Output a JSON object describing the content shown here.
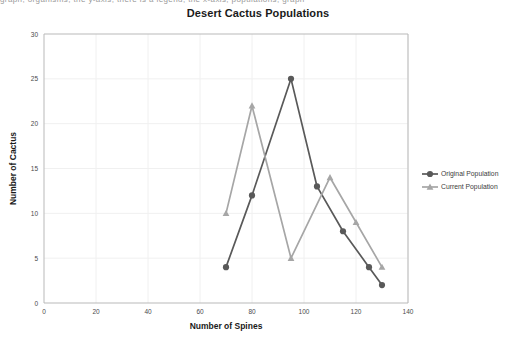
{
  "top_cut_text": "graph, organisms, the y-axis, there is a legend, the x-axis, populations, graph",
  "chart_data": {
    "type": "line",
    "title": "Desert Cactus Populations",
    "xlabel": "Number of Spines",
    "ylabel": "Number of Cactus",
    "xlim": [
      0,
      140
    ],
    "ylim": [
      0,
      30
    ],
    "xticks": [
      "0",
      "20",
      "40",
      "60",
      "80",
      "100",
      "120",
      "140"
    ],
    "yticks": [
      "0",
      "5",
      "10",
      "15",
      "20",
      "25",
      "30"
    ],
    "grid": true,
    "legend_position": "right",
    "series": [
      {
        "name": "Original Population",
        "color": "#595959",
        "marker": "circle",
        "x": [
          70,
          80,
          95,
          105,
          115,
          125,
          130
        ],
        "values": [
          4,
          12,
          25,
          13,
          8,
          4,
          2
        ]
      },
      {
        "name": "Current Population",
        "color": "#a6a6a6",
        "marker": "triangle",
        "x": [
          70,
          80,
          95,
          110,
          120,
          130
        ],
        "values": [
          10,
          22,
          5,
          14,
          9,
          4
        ]
      }
    ]
  }
}
